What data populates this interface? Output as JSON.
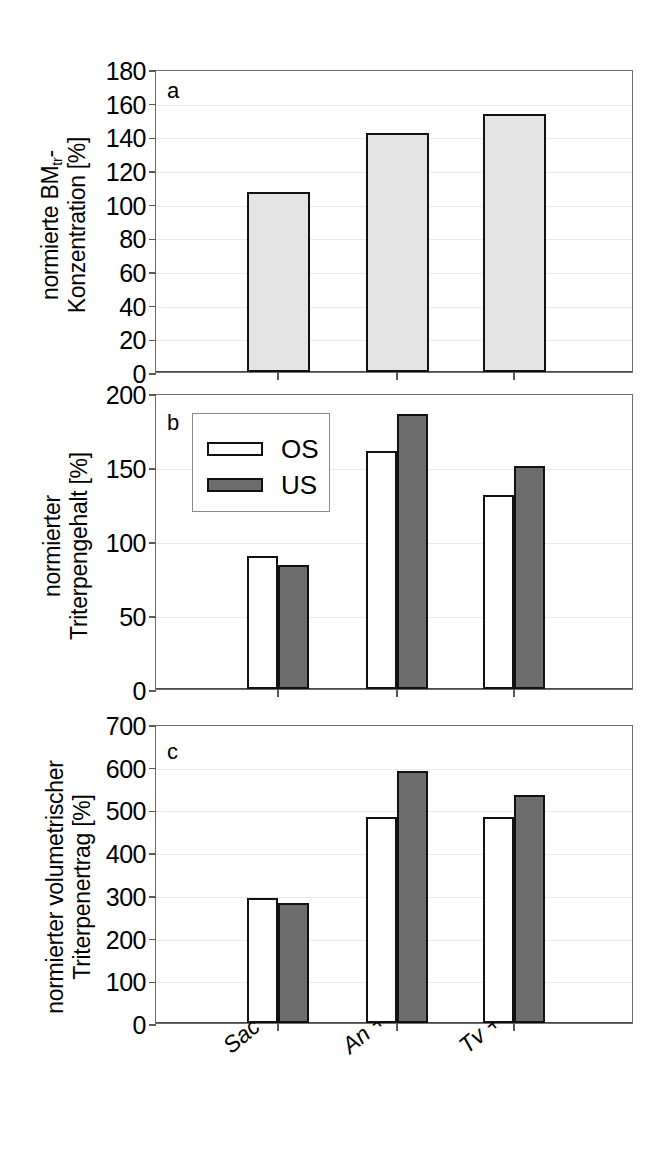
{
  "figure": {
    "background": "#ffffff",
    "width": 672,
    "height": 1169
  },
  "colors": {
    "bar_light_gray": "#e4e4e4",
    "bar_white": "#ffffff",
    "bar_dark_gray": "#6d6d6d",
    "bar_outline": "#111111",
    "axis": "#6e6e6e",
    "gridline": "#e9e9e9"
  },
  "legend": {
    "position": "inside-top-left-panel-b",
    "entries": [
      {
        "label": "OS",
        "swatch": "white"
      },
      {
        "label": "US",
        "swatch": "dark"
      }
    ]
  },
  "x_categories": [
    "Sac",
    "An + Sac",
    "Tv + Sac"
  ],
  "panels": [
    {
      "letter": "a",
      "ylabel_line1": "normierte BM",
      "ylabel_sub": "tr",
      "ylabel_line1_tail": "-",
      "ylabel_line2": "Konzentration [%]",
      "yticks": [
        "0",
        "20",
        "40",
        "60",
        "80",
        "100",
        "120",
        "140",
        "160",
        "180"
      ]
    },
    {
      "letter": "b",
      "ylabel_line1": "normierter",
      "ylabel_line2": "Triterpengehalt [%]",
      "yticks": [
        "0",
        "50",
        "100",
        "150",
        "200"
      ]
    },
    {
      "letter": "c",
      "ylabel_line1": "normierter volumetrischer",
      "ylabel_line2": "Triterpenertrag [%]",
      "yticks": [
        "0",
        "100",
        "200",
        "300",
        "400",
        "500",
        "600",
        "700"
      ]
    }
  ],
  "chart_data": [
    {
      "type": "bar",
      "panel": "a",
      "title": "",
      "xlabel": "",
      "ylabel": "normierte BMtr-Konzentration [%]",
      "categories": [
        "Sac",
        "An + Sac",
        "Tv + Sac"
      ],
      "series": [
        {
          "name": "BMtr",
          "values": [
            107,
            142,
            153
          ],
          "fill": "#e4e4e4"
        }
      ],
      "ylim": [
        0,
        180
      ],
      "ytick_step": 20,
      "grid": true,
      "legend": false
    },
    {
      "type": "bar",
      "panel": "b",
      "title": "",
      "xlabel": "",
      "ylabel": "normierter Triterpengehalt [%]",
      "categories": [
        "Sac",
        "An + Sac",
        "Tv + Sac"
      ],
      "series": [
        {
          "name": "OS",
          "values": [
            90,
            161,
            131
          ],
          "fill": "#ffffff"
        },
        {
          "name": "US",
          "values": [
            84,
            186,
            151
          ],
          "fill": "#6d6d6d"
        }
      ],
      "ylim": [
        0,
        200
      ],
      "ytick_step": 50,
      "grid": true,
      "legend": true,
      "legend_position": "upper-left"
    },
    {
      "type": "bar",
      "panel": "c",
      "title": "",
      "xlabel": "",
      "ylabel": "normierter volumetrischer Triterpenertrag [%]",
      "categories": [
        "Sac",
        "An + Sac",
        "Tv + Sac"
      ],
      "series": [
        {
          "name": "OS",
          "values": [
            292,
            482,
            482
          ],
          "fill": "#ffffff"
        },
        {
          "name": "US",
          "values": [
            280,
            590,
            533
          ],
          "fill": "#6d6d6d"
        }
      ],
      "ylim": [
        0,
        700
      ],
      "ytick_step": 100,
      "grid": true,
      "legend": false
    }
  ]
}
